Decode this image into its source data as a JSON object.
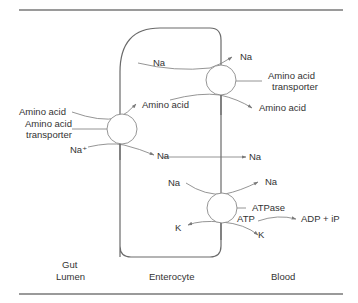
{
  "diagram": {
    "regions": {
      "lumen_line1": "Gut",
      "lumen_line2": "Lumen",
      "cell": "Enterocyte",
      "blood": "Blood"
    },
    "apical_transporter": {
      "label_line1": "Amino acid",
      "label_line2": "transporter",
      "substrate_in": "Amino acid",
      "substrate_out": "Amino acid",
      "ion_in": "Na⁺",
      "ion_out": "Na"
    },
    "basolateral_transporter": {
      "label_line1": "Amino acid",
      "label_line2": "transporter",
      "ion_in": "Na",
      "ion_out": "Na",
      "substrate_out": "Amino acid"
    },
    "sodium_flow": {
      "from": "Na",
      "to": "Na"
    },
    "atpase_pump": {
      "label": "ATPase",
      "energy_in": "ATP",
      "energy_out": "ADP + iP",
      "na_in": "Na",
      "na_out": "Na",
      "k_in": "K",
      "k_out": "K"
    },
    "colors": {
      "rule": "#9a9a9a",
      "cell_outline": "#6a6a6a",
      "text": "#333333",
      "arrow": "#7a7a7a"
    }
  }
}
